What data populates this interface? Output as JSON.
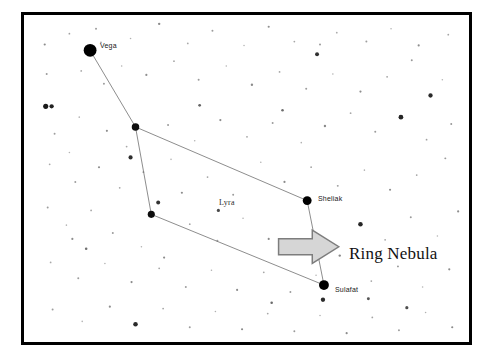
{
  "chart_data": {
    "type": "scatter",
    "xlabel": "",
    "ylabel": "",
    "xlim": [
      0,
      451
    ],
    "ylim": [
      0,
      333
    ],
    "grid": false,
    "legend": null,
    "frame": {
      "border_color": "#000000",
      "border_width": 3,
      "background": "#ffffff",
      "left": 21,
      "top": 12,
      "width": 451,
      "height": 333
    },
    "named_stars": [
      {
        "name": "Vega",
        "x": 67,
        "y": 36,
        "r": 6.5,
        "color": "#000000",
        "label_dx": 9,
        "label_dy": -9
      },
      {
        "name": "Sheliak",
        "x": 287,
        "y": 189,
        "r": 4.5,
        "color": "#000000",
        "label_dx": 7,
        "label_dy": -9
      },
      {
        "name": "Sulafat",
        "x": 304,
        "y": 275,
        "r": 5.0,
        "color": "#000000",
        "label_dx": 7,
        "label_dy": -4
      }
    ],
    "vertex_stars": [
      {
        "name": "delta-lyrae",
        "x": 113,
        "y": 114,
        "r": 3.8,
        "color": "#0d0d0d"
      },
      {
        "name": "zeta-lyrae",
        "x": 129,
        "y": 203,
        "r": 3.6,
        "color": "#0d0d0d"
      }
    ],
    "asterism_lines": {
      "color": "#6e6e6e",
      "width": 0.8,
      "segments": [
        [
          67,
          36,
          113,
          114
        ],
        [
          113,
          114,
          129,
          203
        ],
        [
          113,
          114,
          287,
          189
        ],
        [
          287,
          189,
          304,
          275
        ],
        [
          129,
          203,
          304,
          275
        ]
      ]
    },
    "background_stars": [
      {
        "x": 21,
        "y": 30,
        "r": 1.1,
        "color": "#8c8c8c"
      },
      {
        "x": 46,
        "y": 19,
        "r": 0.9,
        "color": "#a0a0a0"
      },
      {
        "x": 73,
        "y": 14,
        "r": 1.0,
        "color": "#9a9a9a"
      },
      {
        "x": 108,
        "y": 24,
        "r": 0.8,
        "color": "#b0b0b0"
      },
      {
        "x": 137,
        "y": 9,
        "r": 1.2,
        "color": "#8a8a8a"
      },
      {
        "x": 166,
        "y": 29,
        "r": 0.9,
        "color": "#a8a8a8"
      },
      {
        "x": 191,
        "y": 16,
        "r": 1.0,
        "color": "#9c9c9c"
      },
      {
        "x": 223,
        "y": 31,
        "r": 0.8,
        "color": "#b4b4b4"
      },
      {
        "x": 248,
        "y": 12,
        "r": 1.1,
        "color": "#909090"
      },
      {
        "x": 274,
        "y": 27,
        "r": 0.9,
        "color": "#a6a6a6"
      },
      {
        "x": 297,
        "y": 40,
        "r": 2.0,
        "color": "#303030"
      },
      {
        "x": 300,
        "y": 30,
        "r": 1.0,
        "color": "#9a9a9a"
      },
      {
        "x": 317,
        "y": 18,
        "r": 0.9,
        "color": "#ababab"
      },
      {
        "x": 347,
        "y": 27,
        "r": 1.0,
        "color": "#9e9e9e"
      },
      {
        "x": 372,
        "y": 14,
        "r": 0.8,
        "color": "#b2b2b2"
      },
      {
        "x": 400,
        "y": 31,
        "r": 1.1,
        "color": "#8e8e8e"
      },
      {
        "x": 412,
        "y": 82,
        "r": 2.2,
        "color": "#2a2a2a"
      },
      {
        "x": 430,
        "y": 20,
        "r": 0.9,
        "color": "#a4a4a4"
      },
      {
        "x": 23,
        "y": 60,
        "r": 1.0,
        "color": "#9a9a9a"
      },
      {
        "x": 22,
        "y": 93,
        "r": 2.6,
        "color": "#1a1a1a"
      },
      {
        "x": 28,
        "y": 93,
        "r": 2.2,
        "color": "#222222"
      },
      {
        "x": 58,
        "y": 57,
        "r": 0.9,
        "color": "#a9a9a9"
      },
      {
        "x": 81,
        "y": 70,
        "r": 1.0,
        "color": "#9c9c9c"
      },
      {
        "x": 99,
        "y": 52,
        "r": 0.8,
        "color": "#b0b0b0"
      },
      {
        "x": 124,
        "y": 61,
        "r": 1.1,
        "color": "#8f8f8f"
      },
      {
        "x": 152,
        "y": 47,
        "r": 0.9,
        "color": "#a7a7a7"
      },
      {
        "x": 177,
        "y": 66,
        "r": 1.0,
        "color": "#9b9b9b"
      },
      {
        "x": 205,
        "y": 52,
        "r": 0.8,
        "color": "#b3b3b3"
      },
      {
        "x": 231,
        "y": 71,
        "r": 1.2,
        "color": "#8b8b8b"
      },
      {
        "x": 259,
        "y": 58,
        "r": 0.9,
        "color": "#a5a5a5"
      },
      {
        "x": 286,
        "y": 75,
        "r": 1.0,
        "color": "#9d9d9d"
      },
      {
        "x": 313,
        "y": 60,
        "r": 0.8,
        "color": "#b1b1b1"
      },
      {
        "x": 341,
        "y": 78,
        "r": 1.1,
        "color": "#8d8d8d"
      },
      {
        "x": 368,
        "y": 63,
        "r": 0.9,
        "color": "#a2a2a2"
      },
      {
        "x": 393,
        "y": 46,
        "r": 1.0,
        "color": "#999999"
      },
      {
        "x": 424,
        "y": 66,
        "r": 0.8,
        "color": "#b5b5b5"
      },
      {
        "x": 78,
        "y": 28,
        "r": 0.9,
        "color": "#a6a6a6"
      },
      {
        "x": 31,
        "y": 121,
        "r": 1.0,
        "color": "#9e9e9e"
      },
      {
        "x": 56,
        "y": 104,
        "r": 0.8,
        "color": "#b0b0b0"
      },
      {
        "x": 84,
        "y": 118,
        "r": 1.1,
        "color": "#8e8e8e"
      },
      {
        "x": 104,
        "y": 134,
        "r": 0.9,
        "color": "#a7a7a7"
      },
      {
        "x": 146,
        "y": 112,
        "r": 1.0,
        "color": "#9a9a9a"
      },
      {
        "x": 173,
        "y": 128,
        "r": 0.8,
        "color": "#b2b2b2"
      },
      {
        "x": 199,
        "y": 107,
        "r": 1.1,
        "color": "#8c8c8c"
      },
      {
        "x": 226,
        "y": 124,
        "r": 0.9,
        "color": "#a4a4a4"
      },
      {
        "x": 252,
        "y": 110,
        "r": 1.0,
        "color": "#9c9c9c"
      },
      {
        "x": 281,
        "y": 130,
        "r": 0.8,
        "color": "#b0b0b0"
      },
      {
        "x": 305,
        "y": 113,
        "r": 1.2,
        "color": "#8a8a8a"
      },
      {
        "x": 331,
        "y": 100,
        "r": 0.9,
        "color": "#a8a8a8"
      },
      {
        "x": 356,
        "y": 119,
        "r": 1.0,
        "color": "#9b9b9b"
      },
      {
        "x": 382,
        "y": 104,
        "r": 2.4,
        "color": "#252525"
      },
      {
        "x": 408,
        "y": 127,
        "r": 0.9,
        "color": "#a0a0a0"
      },
      {
        "x": 433,
        "y": 111,
        "r": 1.0,
        "color": "#979797"
      },
      {
        "x": 26,
        "y": 152,
        "r": 0.9,
        "color": "#a9a9a9"
      },
      {
        "x": 52,
        "y": 170,
        "r": 1.0,
        "color": "#9d9d9d"
      },
      {
        "x": 46,
        "y": 140,
        "r": 0.8,
        "color": "#b4b4b4"
      },
      {
        "x": 76,
        "y": 155,
        "r": 1.1,
        "color": "#8f8f8f"
      },
      {
        "x": 97,
        "y": 176,
        "r": 0.9,
        "color": "#a5a5a5"
      },
      {
        "x": 121,
        "y": 160,
        "r": 1.0,
        "color": "#9a9a9a"
      },
      {
        "x": 149,
        "y": 147,
        "r": 0.8,
        "color": "#b1b1b1"
      },
      {
        "x": 160,
        "y": 181,
        "r": 1.1,
        "color": "#8d8d8d"
      },
      {
        "x": 186,
        "y": 165,
        "r": 0.9,
        "color": "#a3a3a3"
      },
      {
        "x": 212,
        "y": 183,
        "r": 1.0,
        "color": "#9c9c9c"
      },
      {
        "x": 240,
        "y": 150,
        "r": 0.8,
        "color": "#b2b2b2"
      },
      {
        "x": 264,
        "y": 170,
        "r": 1.1,
        "color": "#8b8b8b"
      },
      {
        "x": 291,
        "y": 155,
        "r": 0.9,
        "color": "#a6a6a6"
      },
      {
        "x": 318,
        "y": 174,
        "r": 1.0,
        "color": "#9e9e9e"
      },
      {
        "x": 345,
        "y": 158,
        "r": 0.8,
        "color": "#b0b0b0"
      },
      {
        "x": 371,
        "y": 178,
        "r": 1.1,
        "color": "#8e8e8e"
      },
      {
        "x": 398,
        "y": 163,
        "r": 0.9,
        "color": "#a2a2a2"
      },
      {
        "x": 427,
        "y": 146,
        "r": 1.0,
        "color": "#999999"
      },
      {
        "x": 108,
        "y": 145,
        "r": 2.1,
        "color": "#2e2e2e"
      },
      {
        "x": 24,
        "y": 196,
        "r": 1.0,
        "color": "#9c9c9c"
      },
      {
        "x": 43,
        "y": 214,
        "r": 0.8,
        "color": "#b3b3b3"
      },
      {
        "x": 49,
        "y": 228,
        "r": 1.1,
        "color": "#8d8d8d"
      },
      {
        "x": 68,
        "y": 199,
        "r": 0.9,
        "color": "#a5a5a5"
      },
      {
        "x": 90,
        "y": 222,
        "r": 1.0,
        "color": "#9b9b9b"
      },
      {
        "x": 119,
        "y": 236,
        "r": 0.8,
        "color": "#b1b1b1"
      },
      {
        "x": 142,
        "y": 247,
        "r": 1.1,
        "color": "#8c8c8c"
      },
      {
        "x": 136,
        "y": 191,
        "r": 2.0,
        "color": "#333333"
      },
      {
        "x": 168,
        "y": 213,
        "r": 0.9,
        "color": "#a4a4a4"
      },
      {
        "x": 196,
        "y": 230,
        "r": 1.0,
        "color": "#9d9d9d"
      },
      {
        "x": 222,
        "y": 207,
        "r": 0.8,
        "color": "#b0b0b0"
      },
      {
        "x": 248,
        "y": 228,
        "r": 1.1,
        "color": "#8a8a8a"
      },
      {
        "x": 197,
        "y": 199,
        "r": 1.6,
        "color": "#4a4a4a"
      },
      {
        "x": 341,
        "y": 213,
        "r": 2.3,
        "color": "#262626"
      },
      {
        "x": 366,
        "y": 229,
        "r": 0.9,
        "color": "#a7a7a7"
      },
      {
        "x": 392,
        "y": 206,
        "r": 1.0,
        "color": "#9a9a9a"
      },
      {
        "x": 419,
        "y": 225,
        "r": 0.8,
        "color": "#b4b4b4"
      },
      {
        "x": 440,
        "y": 200,
        "r": 1.1,
        "color": "#8e8e8e"
      },
      {
        "x": 27,
        "y": 252,
        "r": 0.9,
        "color": "#a8a8a8"
      },
      {
        "x": 55,
        "y": 268,
        "r": 1.0,
        "color": "#9c9c9c"
      },
      {
        "x": 82,
        "y": 253,
        "r": 0.8,
        "color": "#b2b2b2"
      },
      {
        "x": 109,
        "y": 272,
        "r": 1.1,
        "color": "#8b8b8b"
      },
      {
        "x": 137,
        "y": 258,
        "r": 0.9,
        "color": "#a3a3a3"
      },
      {
        "x": 164,
        "y": 277,
        "r": 1.0,
        "color": "#9e9e9e"
      },
      {
        "x": 190,
        "y": 260,
        "r": 0.8,
        "color": "#b0b0b0"
      },
      {
        "x": 216,
        "y": 280,
        "r": 1.1,
        "color": "#8d8d8d"
      },
      {
        "x": 243,
        "y": 262,
        "r": 0.9,
        "color": "#a5a5a5"
      },
      {
        "x": 270,
        "y": 282,
        "r": 1.0,
        "color": "#9b9b9b"
      },
      {
        "x": 296,
        "y": 265,
        "r": 0.8,
        "color": "#b3b3b3"
      },
      {
        "x": 320,
        "y": 245,
        "r": 1.2,
        "color": "#888888"
      },
      {
        "x": 352,
        "y": 271,
        "r": 0.9,
        "color": "#a6a6a6"
      },
      {
        "x": 379,
        "y": 256,
        "r": 1.0,
        "color": "#999999"
      },
      {
        "x": 404,
        "y": 277,
        "r": 0.8,
        "color": "#b1b1b1"
      },
      {
        "x": 431,
        "y": 259,
        "r": 1.1,
        "color": "#8c8c8c"
      },
      {
        "x": 303,
        "y": 290,
        "r": 2.2,
        "color": "#2b2b2b"
      },
      {
        "x": 29,
        "y": 300,
        "r": 1.0,
        "color": "#9d9d9d"
      },
      {
        "x": 59,
        "y": 312,
        "r": 0.8,
        "color": "#b4b4b4"
      },
      {
        "x": 87,
        "y": 297,
        "r": 1.1,
        "color": "#8e8e8e"
      },
      {
        "x": 113,
        "y": 315,
        "r": 2.3,
        "color": "#2a2a2a"
      },
      {
        "x": 141,
        "y": 299,
        "r": 0.9,
        "color": "#a4a4a4"
      },
      {
        "x": 168,
        "y": 318,
        "r": 1.0,
        "color": "#9c9c9c"
      },
      {
        "x": 194,
        "y": 302,
        "r": 0.8,
        "color": "#b0b0b0"
      },
      {
        "x": 221,
        "y": 320,
        "r": 1.1,
        "color": "#8a8a8a"
      },
      {
        "x": 247,
        "y": 304,
        "r": 0.9,
        "color": "#a7a7a7"
      },
      {
        "x": 274,
        "y": 322,
        "r": 1.0,
        "color": "#9a9a9a"
      },
      {
        "x": 300,
        "y": 306,
        "r": 0.8,
        "color": "#b2b2b2"
      },
      {
        "x": 327,
        "y": 324,
        "r": 1.1,
        "color": "#8d8d8d"
      },
      {
        "x": 353,
        "y": 308,
        "r": 0.9,
        "color": "#a3a3a3"
      },
      {
        "x": 380,
        "y": 321,
        "r": 1.0,
        "color": "#9e9e9e"
      },
      {
        "x": 407,
        "y": 303,
        "r": 0.8,
        "color": "#b1b1b1"
      },
      {
        "x": 434,
        "y": 318,
        "r": 1.1,
        "color": "#8b8b8b"
      },
      {
        "x": 388,
        "y": 298,
        "r": 1.6,
        "color": "#4f4f4f"
      },
      {
        "x": 349,
        "y": 289,
        "r": 1.5,
        "color": "#555555"
      },
      {
        "x": 251,
        "y": 293,
        "r": 1.3,
        "color": "#6a6a6a"
      },
      {
        "x": 63,
        "y": 238,
        "r": 1.3,
        "color": "#707070"
      },
      {
        "x": 178,
        "y": 92,
        "r": 1.4,
        "color": "#656565"
      },
      {
        "x": 262,
        "y": 97,
        "r": 1.3,
        "color": "#6d6d6d"
      }
    ],
    "annotation": {
      "text": "Ring Nebula",
      "text_x": 325,
      "text_y": 239,
      "arrow": {
        "name": "right-block-arrow",
        "x": 258,
        "y": 219,
        "width": 61,
        "height": 34,
        "fill": "#d6d6d6",
        "stroke": "#7d7d7d",
        "stroke_width": 1.5,
        "direction": "right"
      }
    },
    "constellation_label": {
      "text": "Lyra",
      "x": 195,
      "y": 183
    }
  }
}
